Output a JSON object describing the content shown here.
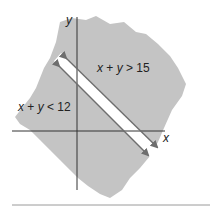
{
  "diagram": {
    "type": "inequality-graph",
    "axes": {
      "x_label": "x",
      "y_label": "y"
    },
    "regions": [
      {
        "label_text": "x + y > 15",
        "parts": [
          "x",
          " + ",
          "y",
          " > 15"
        ],
        "side": "upper-right"
      },
      {
        "label_text": "x + y < 12",
        "parts": [
          "x",
          " + ",
          "y",
          " < 12"
        ],
        "side": "lower-left"
      }
    ],
    "boundary_lines": [
      {
        "equation": "x + y = 15",
        "style": "arrowed"
      },
      {
        "equation": "x + y = 12",
        "style": "arrowed"
      }
    ],
    "colors": {
      "shaded_region": "#c4c4c4",
      "gap_band": "#ffffff",
      "axis": "#333333",
      "arrow_line": "#6e6e6e",
      "rule": "#9a9a9a"
    }
  }
}
